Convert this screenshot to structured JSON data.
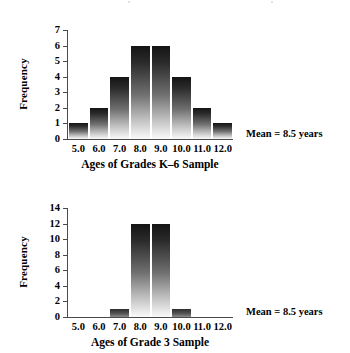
{
  "chart_data": [
    {
      "id": "grades-k6",
      "type": "bar",
      "title": "",
      "xlabel": "Ages of Grades K–6 Sample",
      "ylabel": "Frequency",
      "categories": [
        "5.0",
        "6.0",
        "7.0",
        "8.0",
        "9.0",
        "10.0",
        "11.0",
        "12.0"
      ],
      "values": [
        1,
        2,
        4,
        6,
        6,
        4,
        2,
        1
      ],
      "ylim": [
        0,
        7
      ],
      "yticks": [
        0,
        1,
        2,
        3,
        4,
        5,
        6,
        7
      ],
      "ytick_labels": [
        "0",
        "1",
        "2",
        "3",
        "4",
        "5",
        "6",
        "7"
      ],
      "grid": false,
      "legend": "none",
      "annotation": "Mean = 8.5 years"
    },
    {
      "id": "grade-3",
      "type": "bar",
      "title": "",
      "xlabel": "Ages of Grade 3 Sample",
      "ylabel": "Frequency",
      "categories": [
        "5.0",
        "6.0",
        "7.0",
        "8.0",
        "9.0",
        "10.0",
        "11.0",
        "12.0"
      ],
      "values": [
        0,
        0,
        1,
        12,
        12,
        1,
        0,
        0
      ],
      "ylim": [
        0,
        14
      ],
      "yticks": [
        0,
        2,
        4,
        6,
        8,
        10,
        12,
        14
      ],
      "ytick_labels": [
        "0",
        "2",
        "4",
        "6",
        "8",
        "10",
        "12",
        "14"
      ],
      "grid": false,
      "legend": "none",
      "annotation": "Mean = 8.5 years"
    }
  ]
}
